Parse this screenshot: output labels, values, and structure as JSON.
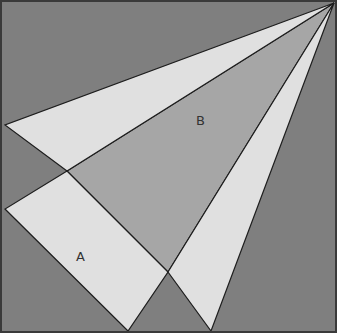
{
  "diagram": {
    "width": 337,
    "height": 333,
    "colors": {
      "background": "#7f7f7f",
      "middle_region": "#a6a6a6",
      "light_region": "#e0e0e0",
      "stroke": "#1e1e1e",
      "border": "#3a3a3a"
    },
    "labels": {
      "a": "A",
      "b": "B"
    },
    "points": {
      "apex": [
        334,
        3
      ],
      "upper_left": [
        5,
        125
      ],
      "upper_cross": [
        67,
        171
      ],
      "lower_left": [
        5,
        209
      ],
      "rect_bottom": [
        128,
        331
      ],
      "lower_cross": [
        168,
        272
      ],
      "narrow_bottom": [
        211,
        331
      ]
    }
  }
}
